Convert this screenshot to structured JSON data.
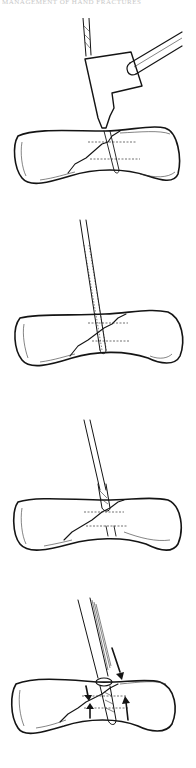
{
  "figure": {
    "header_text": "MANAGEMENT OF HAND FRACTURES",
    "header_visibility": "cropped",
    "panels": [
      {
        "id": 1,
        "description": "Drill guide placed over fracture; drill passes through guide into bone"
      },
      {
        "id": 2,
        "description": "Tap advanced through drilled hole across fracture"
      },
      {
        "id": 3,
        "description": "Countersink / drill bit at near cortex"
      },
      {
        "id": 4,
        "description": "Lag screw inserted; arrows show compression across fracture"
      }
    ],
    "ink_color": "#141414",
    "background_color": "#ffffff"
  }
}
